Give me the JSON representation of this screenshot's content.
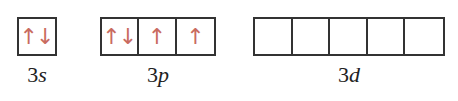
{
  "diagram": {
    "title": "",
    "colors": {
      "arrow": "#c96b5f",
      "box_border": "#333333",
      "label": "#222222"
    },
    "subshells": [
      {
        "label_n": "3",
        "label_l": "s",
        "orbitals": [
          {
            "up": "↑",
            "down": "↓"
          }
        ]
      },
      {
        "label_n": "3",
        "label_l": "p",
        "orbitals": [
          {
            "up": "↑",
            "down": "↓"
          },
          {
            "up": "↑",
            "down": null
          },
          {
            "up": "↑",
            "down": null
          }
        ]
      },
      {
        "label_n": "3",
        "label_l": "d",
        "orbitals": [
          {
            "up": null,
            "down": null
          },
          {
            "up": null,
            "down": null
          },
          {
            "up": null,
            "down": null
          },
          {
            "up": null,
            "down": null
          },
          {
            "up": null,
            "down": null
          }
        ]
      }
    ]
  }
}
